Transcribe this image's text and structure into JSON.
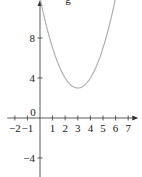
{
  "chart_data": {
    "type": "line",
    "title": "g",
    "xlabel": "",
    "ylabel": "",
    "xlim": [
      -2.6,
      7.8
    ],
    "ylim": [
      -5.9,
      11.8
    ],
    "x_ticks": [
      -2,
      -1,
      1,
      2,
      3,
      4,
      5,
      6,
      7
    ],
    "x_tick_labels": [
      "−2",
      "−1",
      "1",
      "2",
      "3",
      "4",
      "5",
      "6",
      "7"
    ],
    "y_ticks": [
      8,
      4,
      -4
    ],
    "y_tick_labels": [
      "8",
      "4",
      "−4"
    ],
    "origin_label": "0",
    "series": [
      {
        "name": "g",
        "function": "(x-3)^2 + 3",
        "x": [
          0.0,
          0.5,
          1,
          1.5,
          2,
          2.5,
          3,
          3.5,
          4,
          4.5,
          5,
          5.5,
          6
        ],
        "y": [
          12,
          9.25,
          7,
          5.25,
          4,
          3.25,
          3,
          3.25,
          4,
          5.25,
          7,
          9.25,
          12
        ]
      }
    ],
    "colors": {
      "curve": "#b0b0b0",
      "axis": "#333333"
    },
    "grid": false
  }
}
